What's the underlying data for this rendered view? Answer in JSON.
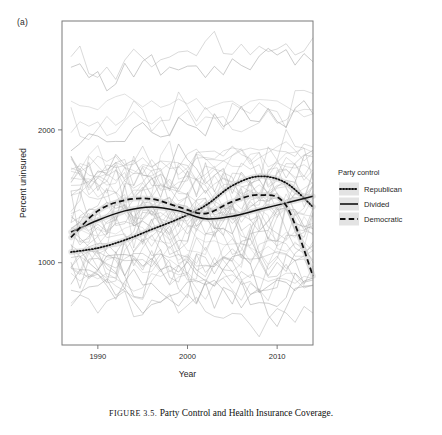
{
  "figure": {
    "panel_label": "(a)",
    "caption_prefix": "FIGURE 3.5.",
    "caption_text": "Party Control and Health Insurance Coverage."
  },
  "legend": {
    "title": "Party control",
    "items": [
      {
        "label": "Republican",
        "style": "dotted",
        "color": "#111111"
      },
      {
        "label": "Divided",
        "style": "solid",
        "color": "#111111"
      },
      {
        "label": "Democratic",
        "style": "dashed",
        "color": "#111111"
      }
    ]
  },
  "chart_data": {
    "type": "line",
    "title": "",
    "xlabel": "Year",
    "ylabel": "Percent uninsured",
    "xlim": [
      1986,
      2014
    ],
    "ylim": [
      380,
      2820
    ],
    "grid": false,
    "legend_position": "right",
    "xticks": [
      1990,
      2000,
      2010
    ],
    "xtick_labels": [
      "1990",
      "2000",
      "2010"
    ],
    "yticks": [
      1000,
      2000
    ],
    "ytick_labels": [
      "1000",
      "2000"
    ],
    "background_series": {
      "name": "State trajectories",
      "color": "#a8a8a8",
      "count": 51,
      "note": "Thin gray spaghetti lines, one per state, 1987-2014"
    },
    "series": [
      {
        "name": "Republican",
        "style": "dotted",
        "color": "#111111",
        "x": [
          1987,
          1990,
          1993,
          1996,
          1999,
          2002,
          2005,
          2008,
          2011,
          2014
        ],
        "y": [
          1080,
          1110,
          1170,
          1250,
          1330,
          1430,
          1580,
          1650,
          1600,
          1420
        ]
      },
      {
        "name": "Divided",
        "style": "solid",
        "color": "#111111",
        "x": [
          1987,
          1990,
          1993,
          1996,
          1999,
          2002,
          2005,
          2008,
          2011,
          2014
        ],
        "y": [
          1230,
          1320,
          1390,
          1420,
          1390,
          1330,
          1350,
          1400,
          1450,
          1500
        ]
      },
      {
        "name": "Democratic",
        "style": "dashed",
        "color": "#111111",
        "x": [
          1987,
          1990,
          1993,
          1996,
          1999,
          2002,
          2005,
          2008,
          2011,
          2014
        ],
        "y": [
          1190,
          1390,
          1470,
          1480,
          1420,
          1370,
          1460,
          1510,
          1430,
          900
        ]
      }
    ]
  }
}
